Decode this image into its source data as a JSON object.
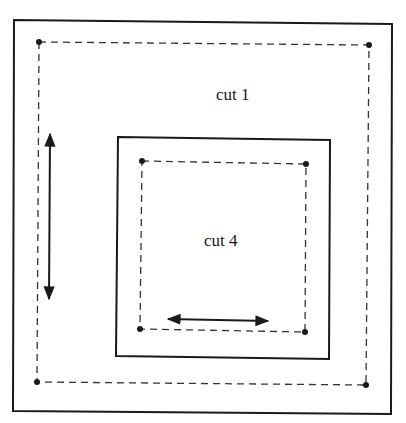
{
  "diagram": {
    "labels": {
      "outer_cut": "cut 1",
      "inner_cut": "cut 4"
    },
    "colors": {
      "line": "#1a1a1a",
      "background": "#ffffff"
    },
    "outer_frame": {
      "x1": 13,
      "y1": 20,
      "x2": 392,
      "y2": 414
    },
    "outer_cut_path": {
      "points": [
        [
          39,
          42
        ],
        [
          369,
          45
        ],
        [
          366,
          385
        ],
        [
          37,
          382
        ]
      ],
      "style": "dashed"
    },
    "inner_frame": {
      "x1": 117,
      "y1": 137,
      "x2": 330,
      "y2": 359
    },
    "inner_cut_path": {
      "points": [
        [
          142,
          161
        ],
        [
          306,
          164
        ],
        [
          305,
          332
        ],
        [
          140,
          329
        ]
      ],
      "style": "dashed"
    },
    "arrows": [
      {
        "name": "vertical-double-arrow",
        "from": [
          50,
          132
        ],
        "to": [
          49,
          301
        ]
      },
      {
        "name": "horizontal-double-arrow",
        "from": [
          166,
          319
        ],
        "to": [
          270,
          321
        ]
      }
    ]
  }
}
